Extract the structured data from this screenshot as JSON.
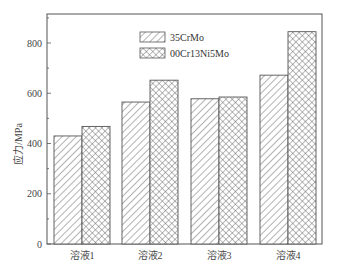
{
  "chart_data": {
    "type": "bar",
    "title": "",
    "xlabel": "",
    "ylabel": "应力/MPa",
    "ylim": [
      0,
      900
    ],
    "yticks": [
      0,
      200,
      400,
      600,
      800
    ],
    "grid": false,
    "legend_position": "top-center-inside",
    "categories": [
      "溶液1",
      "溶液2",
      "溶液3",
      "溶液4"
    ],
    "series": [
      {
        "name": "35CrMo",
        "pattern": "diagonal-hatch",
        "values": [
          430,
          565,
          578,
          672
        ]
      },
      {
        "name": "00Cr13Ni5Mo",
        "pattern": "crosshatch",
        "values": [
          468,
          652,
          585,
          845
        ]
      }
    ]
  },
  "colors": {
    "axis": "#555555",
    "bar_edge": "#555555",
    "hatch": "#555555",
    "background": "#ffffff"
  }
}
